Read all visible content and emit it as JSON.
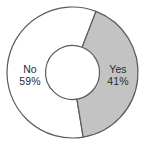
{
  "chart_data": {
    "type": "pie",
    "variant": "donut",
    "title": "",
    "subtitle": "",
    "xlabel": "",
    "ylabel": "",
    "legend": "none",
    "grid": false,
    "data_labels_inside": true,
    "start_angle_deg": 21,
    "direction": "clockwise",
    "categories": [
      "Yes",
      "No"
    ],
    "values": [
      41,
      59
    ],
    "units": "%",
    "slices": [
      {
        "label": "Yes",
        "value": 41,
        "value_text": "41%",
        "fill": "#c3c3c3",
        "stroke": "#5a5a5a",
        "start_angle_deg": 21,
        "end_angle_deg": 170.6,
        "sweep_deg": 149.6
      },
      {
        "label": "No",
        "value": 59,
        "value_text": "59%",
        "fill": "#ffffff",
        "stroke": "#5a5a5a",
        "start_angle_deg": 170.6,
        "end_angle_deg": 381,
        "sweep_deg": 210.4
      }
    ],
    "geometry": {
      "center_x": 72.5,
      "center_y": 72.5,
      "outer_radius": 65.5,
      "inner_radius": 27.0
    }
  },
  "colors": {
    "background": "#ffffff",
    "outline": "#5a5a5a",
    "slice_yes_fill": "#c3c3c3",
    "slice_no_fill": "#ffffff",
    "label_text": "#2b2b2b"
  },
  "labels": {
    "no": {
      "name": "No",
      "value": "59%"
    },
    "yes": {
      "name": "Yes",
      "value": "41%"
    }
  }
}
